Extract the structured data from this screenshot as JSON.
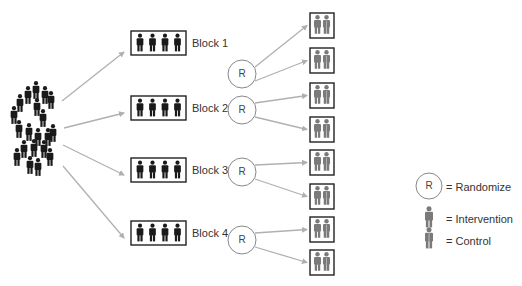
{
  "diagram": {
    "type": "block-randomization",
    "colors": {
      "person_dark": "#1a1a1a",
      "intervention": "#7a7a7a",
      "control_stripe": "#b5b5b5",
      "arrow": "#b0b0b0",
      "box_border": "#222222",
      "circle_border": "#888888"
    },
    "population": {
      "label": "",
      "people": [
        [
          36,
          91
        ],
        [
          28,
          96
        ],
        [
          45,
          96
        ],
        [
          51,
          101
        ],
        [
          20,
          104
        ],
        [
          37,
          108
        ],
        [
          14,
          116
        ],
        [
          43,
          119
        ],
        [
          19,
          130
        ],
        [
          29,
          133
        ],
        [
          38,
          138
        ],
        [
          48,
          138
        ],
        [
          53,
          134
        ],
        [
          24,
          150
        ],
        [
          34,
          149
        ],
        [
          44,
          150
        ],
        [
          17,
          158
        ],
        [
          50,
          158
        ],
        [
          30,
          166
        ],
        [
          38,
          168
        ]
      ]
    },
    "blocks": [
      {
        "label": "Block 1",
        "box": [
          131,
          31,
          55,
          24
        ],
        "circle": [
          242,
          74
        ],
        "r_label": "R",
        "groups_y": [
          13,
          48
        ]
      },
      {
        "label": "Block 2",
        "box": [
          131,
          96,
          55,
          24
        ],
        "circle": [
          242,
          110
        ],
        "r_label": "R",
        "groups_y": [
          83,
          117
        ]
      },
      {
        "label": "Block 3",
        "box": [
          131,
          158,
          55,
          24
        ],
        "circle": [
          242,
          172
        ],
        "r_label": "R",
        "groups_y": [
          150,
          184
        ]
      },
      {
        "label": "Block 4",
        "box": [
          131,
          221,
          55,
          24
        ],
        "circle": [
          242,
          240
        ],
        "r_label": "R",
        "groups_y": [
          217,
          250
        ]
      }
    ],
    "block_label_x": 192,
    "group_box_x": 310,
    "group_box_w": 24,
    "group_box_h": 25,
    "source_arrows": [
      [
        62,
        101,
        124,
        52
      ],
      [
        64,
        128,
        124,
        113
      ],
      [
        63,
        145,
        124,
        175
      ],
      [
        63,
        166,
        124,
        238
      ]
    ],
    "legend": {
      "randomize_symbol": "R",
      "randomize_label": "= Randomize",
      "intervention_label": "= Intervention",
      "control_label": "= Control"
    }
  }
}
